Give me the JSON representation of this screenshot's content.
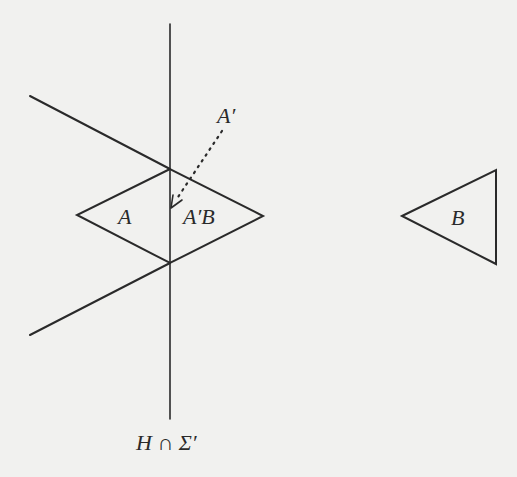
{
  "figure": {
    "labels": {
      "a_prime": "A′",
      "a": "A",
      "a_prime_b": "A′B",
      "b": "B",
      "axis": "H ∩ Σ′"
    },
    "colors": {
      "background": "#f1f1ef",
      "stroke": "#2a2a2a"
    },
    "elements": [
      {
        "id": "vertical-line",
        "type": "line",
        "label": "H ∩ Σ′"
      },
      {
        "id": "upper-diagonal",
        "type": "line"
      },
      {
        "id": "lower-diagonal",
        "type": "line"
      },
      {
        "id": "rhombus",
        "type": "polygon",
        "labels": [
          "A",
          "A′B"
        ]
      },
      {
        "id": "triangle-b",
        "type": "polygon",
        "label": "B"
      },
      {
        "id": "dotted-arrow",
        "type": "arrow",
        "style": "dotted",
        "from": "A′",
        "to": "rhombus"
      }
    ]
  }
}
